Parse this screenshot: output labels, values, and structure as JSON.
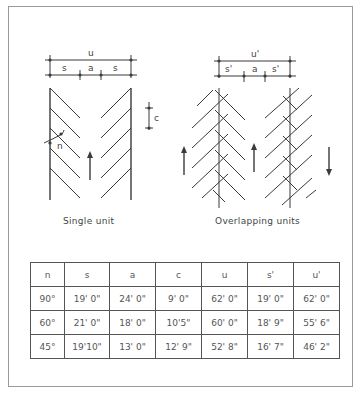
{
  "diagram": {
    "single_unit": {
      "caption": "Single unit",
      "labels": {
        "u": "u",
        "s_left": "s",
        "a": "a",
        "s_right": "s",
        "c": "c",
        "n": "n"
      }
    },
    "overlapping_units": {
      "caption": "Overlapping units",
      "labels": {
        "u": "u'",
        "s_left": "s'",
        "a": "a",
        "s_right": "s'"
      }
    }
  },
  "table": {
    "headers": [
      "n",
      "s",
      "a",
      "c",
      "u",
      "s'",
      "u'"
    ],
    "rows": [
      [
        "90°",
        "19' 0\"",
        "24' 0\"",
        "9' 0\"",
        "62' 0\"",
        "19' 0\"",
        "62' 0\""
      ],
      [
        "60°",
        "21' 0\"",
        "18' 0\"",
        "10'5\"",
        "60' 0\"",
        "18' 9\"",
        "55' 6\""
      ],
      [
        "45°",
        "19'10\"",
        "13' 0\"",
        "12' 9\"",
        "52' 8\"",
        "16' 7\"",
        "46' 2\""
      ]
    ],
    "column_widths": [
      33,
      44,
      45,
      45,
      45,
      45,
      45
    ]
  },
  "colors": {
    "line": "#3a3a3a",
    "frame": "#9a9a9a"
  }
}
